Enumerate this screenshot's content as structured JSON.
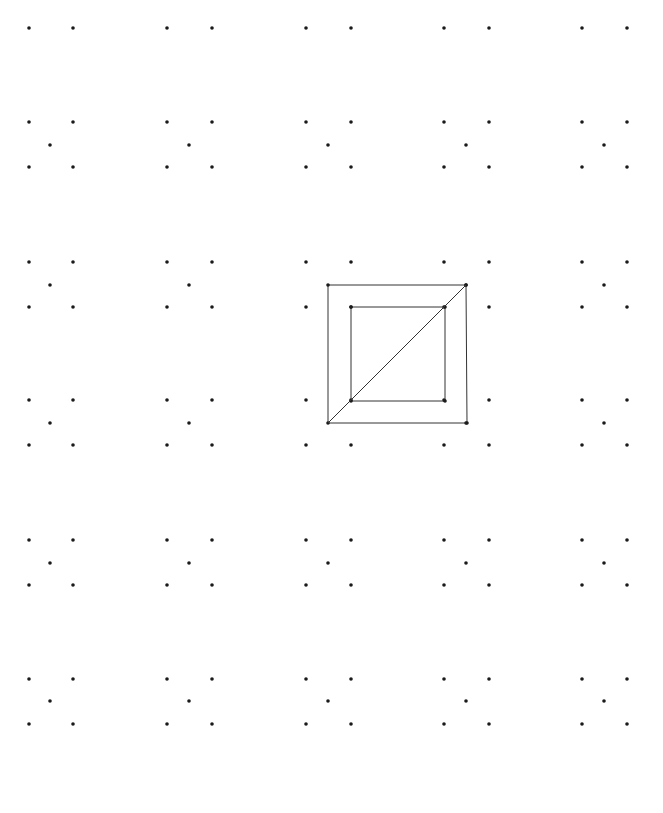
{
  "canvas": {
    "width": 663,
    "height": 813,
    "background": "#ffffff"
  },
  "style": {
    "dot_color": "#1a1a1a",
    "dot_radius": 1.8,
    "line_color": "#333333",
    "line_width": 1
  },
  "grid": {
    "column_pairs": [
      [
        29,
        73
      ],
      [
        167,
        212
      ],
      [
        306,
        351
      ],
      [
        444,
        489
      ],
      [
        582,
        627
      ]
    ],
    "column_centers": [
      50,
      189,
      328,
      466,
      604
    ],
    "top_row_y": 28,
    "cell_rows": [
      {
        "y_top": 122,
        "y_bottom": 167,
        "y_center": 145,
        "center_dot_columns": [
          0,
          1,
          2,
          3,
          4
        ]
      },
      {
        "y_top": 262,
        "y_bottom": 307,
        "y_center": 285,
        "center_dot_columns": [
          0,
          1,
          3,
          4
        ]
      },
      {
        "y_top": 400,
        "y_bottom": 445,
        "y_center": 423,
        "center_dot_columns": [
          0,
          1,
          3,
          4
        ]
      },
      {
        "y_top": 540,
        "y_bottom": 585,
        "y_center": 563,
        "center_dot_columns": [
          0,
          1,
          2,
          3,
          4
        ]
      },
      {
        "y_top": 679,
        "y_bottom": 724,
        "y_center": 701,
        "center_dot_columns": [
          0,
          1,
          2,
          3,
          4
        ]
      }
    ]
  },
  "figure": {
    "outer_square": [
      [
        328,
        285
      ],
      [
        466,
        285
      ],
      [
        467,
        423
      ],
      [
        328,
        423
      ]
    ],
    "inner_square": [
      [
        351,
        307
      ],
      [
        445,
        307
      ],
      [
        445,
        401
      ],
      [
        351,
        401
      ]
    ],
    "diagonal": [
      [
        328,
        423
      ],
      [
        466,
        285
      ]
    ]
  }
}
